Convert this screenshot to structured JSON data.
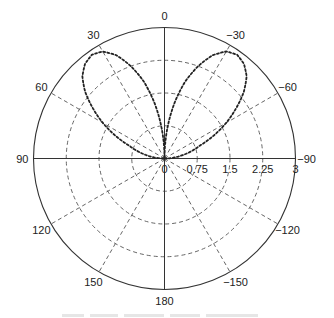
{
  "chart_data": {
    "type": "polar_line",
    "title": "",
    "center_px": [
      164.5,
      158.5
    ],
    "radius_px": 131,
    "r_max": 3,
    "radial_ticks": [
      0,
      0.75,
      1.5,
      2.25,
      3
    ],
    "radial_tick_labels": [
      "0",
      "0.75",
      "1.5",
      "2.25",
      "3"
    ],
    "angle_ticks_deg": [
      0,
      30,
      60,
      90,
      120,
      150,
      180,
      -150,
      -120,
      -90,
      -60,
      -30
    ],
    "angle_tick_labels": [
      "0",
      "30",
      "60",
      "90",
      "120",
      "150",
      "180",
      "−150",
      "−120",
      "−90",
      "−60",
      "−30"
    ],
    "angle_convention": "0 at top, positive angles counter-clockwise (to the left)",
    "grid": true,
    "grid_style": "dashed",
    "series": [
      {
        "name": "pattern",
        "style": "dotted",
        "color": "#222222",
        "theta_deg": [
          -90,
          -80,
          -70,
          -60,
          -50,
          -45,
          -40,
          -35,
          -30,
          -25,
          -20,
          -15,
          -10,
          -5,
          0,
          5,
          10,
          15,
          20,
          25,
          30,
          35,
          40,
          45,
          50,
          60,
          70,
          80,
          90
        ],
        "r": [
          0,
          0.4,
          0.86,
          1.63,
          2.37,
          2.66,
          2.83,
          2.9,
          2.83,
          2.61,
          2.25,
          1.82,
          1.27,
          0.65,
          0,
          0.65,
          1.27,
          1.82,
          2.25,
          2.61,
          2.83,
          2.9,
          2.83,
          2.66,
          2.37,
          1.63,
          0.86,
          0.4,
          0
        ]
      }
    ],
    "legend": null
  },
  "caption": {
    "visible": true,
    "legible": false
  }
}
